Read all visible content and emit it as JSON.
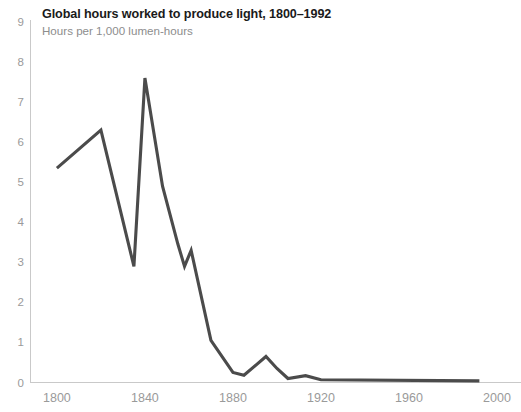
{
  "header": {
    "title": "Global hours worked to produce light, 1800–1992",
    "subtitle": "Hours per 1,000 lumen-hours"
  },
  "colors": {
    "line": "#4b4b4b",
    "axis": "#c9c9c9",
    "tick_text": "#9a9a9a",
    "title_text": "#1a1a1a",
    "subtitle_text": "#8d8d8d",
    "background": "#ffffff"
  },
  "axes": {
    "y_ticks": [
      "0",
      "1",
      "2",
      "3",
      "4",
      "5",
      "6",
      "7",
      "8",
      "9"
    ],
    "x_ticks": [
      "1800",
      "1840",
      "1880",
      "1920",
      "1960",
      "2000"
    ]
  },
  "chart_data": {
    "type": "line",
    "title": "Global hours worked to produce light, 1800–1992",
    "subtitle": "Hours per 1,000 lumen-hours",
    "xlabel": "",
    "ylabel": "Hours per 1,000 lumen-hours",
    "xlim": [
      1788,
      2005
    ],
    "ylim": [
      0,
      9
    ],
    "xticks": [
      1800,
      1840,
      1880,
      1920,
      1960,
      2000
    ],
    "yticks": [
      0,
      1,
      2,
      3,
      4,
      5,
      6,
      7,
      8,
      9
    ],
    "grid": false,
    "legend": false,
    "series": [
      {
        "name": "Hours worked per 1,000 lumen-hours",
        "color": "#4b4b4b",
        "x": [
          1800,
          1820,
          1835,
          1840,
          1848,
          1855,
          1858,
          1861,
          1870,
          1880,
          1885,
          1895,
          1900,
          1905,
          1913,
          1920,
          1992
        ],
        "y": [
          5.35,
          6.3,
          2.9,
          7.6,
          4.9,
          3.45,
          2.9,
          3.3,
          1.05,
          0.25,
          0.18,
          0.65,
          0.35,
          0.1,
          0.17,
          0.07,
          0.04
        ]
      }
    ]
  }
}
